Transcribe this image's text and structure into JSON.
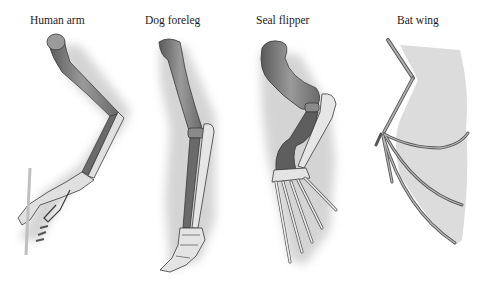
{
  "figure": {
    "panels": [
      {
        "id": "human",
        "label": "Human arm"
      },
      {
        "id": "dog",
        "label": "Dog foreleg"
      },
      {
        "id": "seal",
        "label": "Seal flipper"
      },
      {
        "id": "bat",
        "label": "Bat wing"
      }
    ],
    "colors": {
      "background": "#ffffff",
      "shadow": "#d6d6d6",
      "humerus": "#8e8e8e",
      "ulna_radius_dark": "#6e6e6e",
      "bone_light": "#e4e4e4",
      "outline": "#3a3a3a",
      "membrane": "#d9d9d9"
    }
  }
}
